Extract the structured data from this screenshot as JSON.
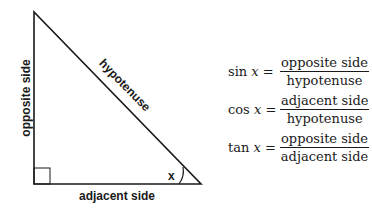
{
  "triangle": {
    "labels": {
      "opposite": "opposite side",
      "adjacent": "adjacent side",
      "hypotenuse": "hypotenuse",
      "angle": "x"
    }
  },
  "formulas": [
    {
      "func": "sin",
      "var": "x",
      "eq": "=",
      "numerator": "opposite side",
      "denominator": "hypotenuse"
    },
    {
      "func": "cos",
      "var": "x",
      "eq": "=",
      "numerator": "adjacent side",
      "denominator": "hypotenuse"
    },
    {
      "func": "tan",
      "var": "x",
      "eq": "=",
      "numerator": "opposite side",
      "denominator": "adjacent side"
    }
  ],
  "colors": {
    "stroke": "#1a1a1a",
    "background": "#ffffff"
  }
}
